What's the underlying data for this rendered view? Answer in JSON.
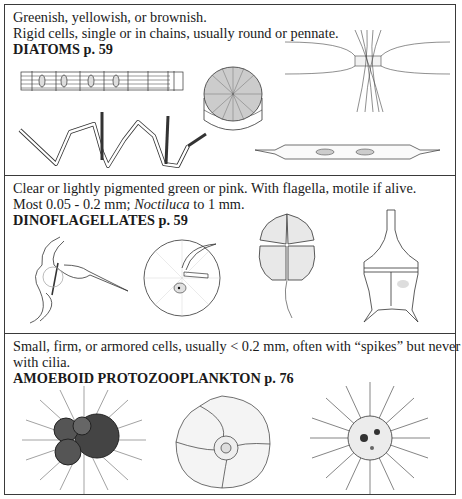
{
  "sections": [
    {
      "line1": "Greenish, yellowish, or brownish.",
      "line2": "Rigid cells, single or in chains, usually round or pennate.",
      "title": "DIATOMS p. 59",
      "illustrations": [
        "diatom-chain-straight",
        "diatom-chain-zigzag",
        "centric-diatom-disc",
        "chaetoceros-chain",
        "pennate-diatom"
      ]
    },
    {
      "line1": "Clear or lightly pigmented green or pink. With flagella, motile if alive.",
      "line2_a": "Most 0.05 - 0.2 mm; ",
      "line2_italic": "Noctiluca",
      "line2_b": " to 1 mm.",
      "title": "DINOFLAGELLATES p. 59",
      "illustrations": [
        "ceratium-dinoflagellate",
        "noctiluca",
        "dinophysis-armored",
        "peridinium-spined"
      ]
    },
    {
      "line1": "Small, firm, or armored cells, usually < 0.2 mm, often with “spikes” but never",
      "line2": "with cilia.",
      "title": "AMOEBOID PROTOZOOPLANKTON p. 76",
      "illustrations": [
        "globigerina-foraminifera",
        "coiled-foraminifera",
        "radiolarian"
      ]
    }
  ]
}
